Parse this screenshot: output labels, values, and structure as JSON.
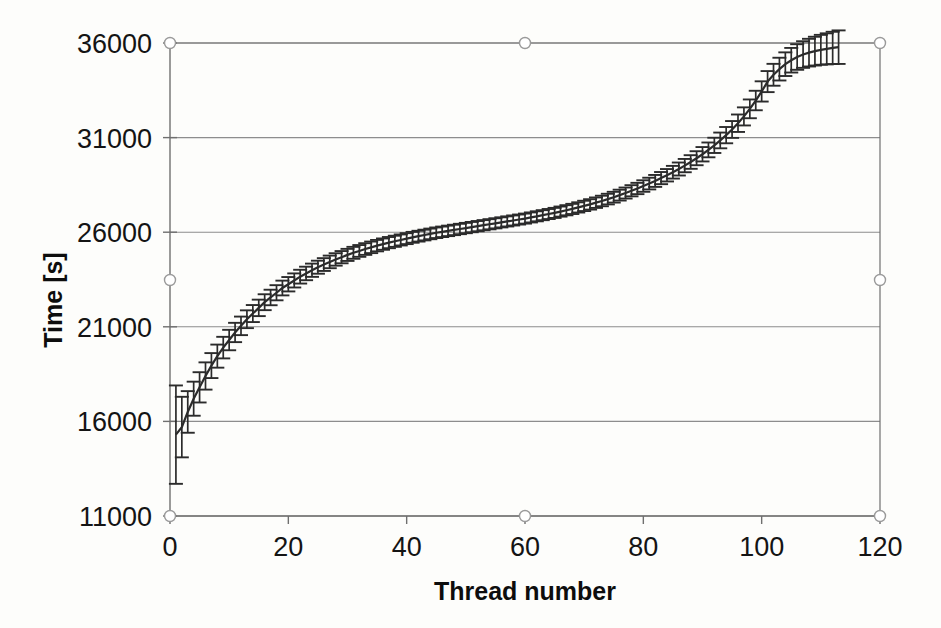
{
  "figure": {
    "background_color": "#fdfdfb",
    "ink_color": "#2b2b2b",
    "grid_color": "#8d8d8d",
    "axis_color": "#6f6f6f"
  },
  "axes": {
    "y_title": "Time [s]",
    "x_title": "Thread number",
    "y_ticks": [
      "11000",
      "16000",
      "21000",
      "26000",
      "31000",
      "36000"
    ],
    "x_ticks": [
      "0",
      "20",
      "40",
      "60",
      "80",
      "100",
      "120"
    ]
  },
  "chart_data": {
    "type": "line",
    "title": "",
    "subtitle": "",
    "xlabel": "Thread number",
    "ylabel": "Time [s]",
    "xlim": [
      0,
      120
    ],
    "ylim": [
      11000,
      36000
    ],
    "xticks": [
      0,
      20,
      40,
      60,
      80,
      100,
      120
    ],
    "yticks": [
      11000,
      16000,
      21000,
      26000,
      31000,
      36000
    ],
    "grid": "horizontal",
    "legend": "none",
    "error_bars": "vertical-with-caps",
    "marker": "none",
    "series": [
      {
        "name": "Thread completion time",
        "x": [
          1,
          2,
          3,
          4,
          5,
          6,
          7,
          8,
          9,
          10,
          11,
          12,
          13,
          14,
          15,
          16,
          17,
          18,
          19,
          20,
          21,
          22,
          23,
          24,
          25,
          26,
          27,
          28,
          29,
          30,
          31,
          32,
          33,
          34,
          35,
          36,
          37,
          38,
          39,
          40,
          41,
          42,
          43,
          44,
          45,
          46,
          47,
          48,
          49,
          50,
          51,
          52,
          53,
          54,
          55,
          56,
          57,
          58,
          59,
          60,
          61,
          62,
          63,
          64,
          65,
          66,
          67,
          68,
          69,
          70,
          71,
          72,
          73,
          74,
          75,
          76,
          77,
          78,
          79,
          80,
          81,
          82,
          83,
          84,
          85,
          86,
          87,
          88,
          89,
          90,
          91,
          92,
          93,
          94,
          95,
          96,
          97,
          98,
          99,
          100,
          101,
          102,
          103,
          104,
          105,
          106,
          107,
          108,
          109,
          110,
          111,
          112,
          113
        ],
        "y": [
          15300,
          15700,
          16500,
          17200,
          17800,
          18400,
          18950,
          19450,
          19900,
          20300,
          20700,
          21050,
          21400,
          21700,
          22000,
          22300,
          22550,
          22800,
          23050,
          23250,
          23450,
          23650,
          23820,
          23990,
          24150,
          24290,
          24430,
          24560,
          24680,
          24800,
          24910,
          25010,
          25110,
          25200,
          25290,
          25370,
          25450,
          25520,
          25590,
          25660,
          25730,
          25790,
          25850,
          25910,
          25970,
          26020,
          26070,
          26120,
          26170,
          26220,
          26270,
          26320,
          26370,
          26420,
          26470,
          26520,
          26570,
          26620,
          26670,
          26720,
          26780,
          26840,
          26900,
          26960,
          27020,
          27090,
          27160,
          27230,
          27310,
          27390,
          27470,
          27560,
          27650,
          27750,
          27850,
          27960,
          28070,
          28190,
          28310,
          28440,
          28570,
          28710,
          28860,
          29010,
          29170,
          29340,
          29520,
          29710,
          29910,
          30120,
          30350,
          30590,
          30850,
          31130,
          31430,
          31760,
          32120,
          32520,
          32960,
          33440,
          33960,
          34320,
          34620,
          34880,
          35090,
          35260,
          35390,
          35490,
          35570,
          35640,
          35690,
          35740,
          35780
        ],
        "yerr": [
          2600,
          1600,
          1100,
          900,
          800,
          720,
          660,
          610,
          570,
          540,
          510,
          490,
          470,
          450,
          435,
          420,
          410,
          400,
          390,
          380,
          372,
          364,
          357,
          350,
          344,
          338,
          333,
          328,
          323,
          319,
          315,
          311,
          308,
          305,
          302,
          299,
          296,
          294,
          291,
          289,
          287,
          285,
          283,
          281,
          280,
          278,
          277,
          275,
          274,
          273,
          272,
          271,
          270,
          269,
          268,
          267,
          267,
          266,
          265,
          265,
          265,
          265,
          265,
          266,
          266,
          267,
          268,
          269,
          270,
          272,
          274,
          276,
          278,
          281,
          284,
          287,
          291,
          295,
          299,
          304,
          309,
          315,
          321,
          328,
          335,
          343,
          351,
          360,
          370,
          380,
          391,
          403,
          416,
          430,
          445,
          461,
          478,
          496,
          515,
          535,
          556,
          578,
          601,
          625,
          650,
          676,
          703,
          731,
          760,
          790,
          821,
          853,
          886
        ]
      }
    ]
  },
  "selection_handles": [
    {
      "name": "handle-top-left",
      "x": 170,
      "y": 43
    },
    {
      "name": "handle-top-center",
      "x": 525,
      "y": 43
    },
    {
      "name": "handle-top-right",
      "x": 880,
      "y": 43
    },
    {
      "name": "handle-middle-left",
      "x": 170,
      "y": 280
    },
    {
      "name": "handle-middle-right",
      "x": 880,
      "y": 280
    },
    {
      "name": "handle-bottom-left",
      "x": 170,
      "y": 516
    },
    {
      "name": "handle-bottom-center",
      "x": 525,
      "y": 516
    },
    {
      "name": "handle-bottom-right",
      "x": 880,
      "y": 516
    }
  ]
}
